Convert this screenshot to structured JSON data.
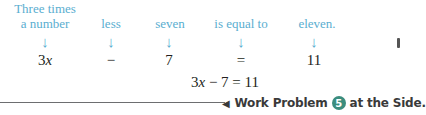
{
  "translation": {
    "columns": [
      {
        "phrase_line1": "Three times",
        "phrase_line2": "a number",
        "arrow": "↓",
        "term": "3x"
      },
      {
        "phrase_line1": "",
        "phrase_line2": "less",
        "arrow": "↓",
        "term": "−"
      },
      {
        "phrase_line1": "",
        "phrase_line2": "seven",
        "arrow": "↓",
        "term": "7"
      },
      {
        "phrase_line1": "",
        "phrase_line2": "is equal to",
        "arrow": "↓",
        "term": "="
      },
      {
        "phrase_line1": "",
        "phrase_line2": "eleven.",
        "arrow": "↓",
        "term": "11"
      }
    ]
  },
  "equation": {
    "coef": "3",
    "var": "x",
    "rest": " − 7 = 11"
  },
  "footer": {
    "pointer": "◀",
    "prefix": "Work Problem",
    "problem_number": "5",
    "suffix": "at the Side."
  },
  "colors": {
    "phrase": "#5aaed0",
    "math": "#231f20",
    "badge": "#3b8d7e",
    "rule": "#6d6e70"
  }
}
